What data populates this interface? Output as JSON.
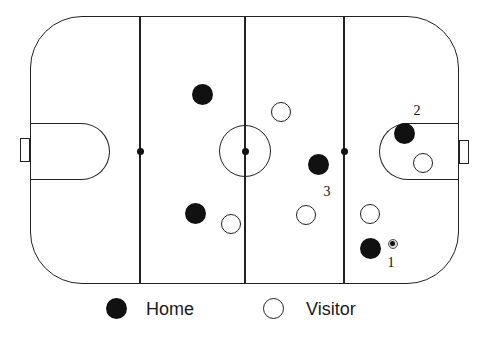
{
  "colors": {
    "background": "#ffffff",
    "line_stroke": "#222222",
    "home_fill": "#111111",
    "visitor_fill": "#ffffff",
    "text": "#1a1a1a"
  },
  "rink": {
    "x": 30,
    "y": 16,
    "width": 429,
    "height": 268,
    "corner_radius": 52,
    "vertical_lines_x": [
      140,
      245,
      344
    ],
    "faceoff_dots": [
      {
        "x": 140,
        "y": 151,
        "r": 3.5
      },
      {
        "x": 245,
        "y": 151,
        "r": 3.5
      },
      {
        "x": 344,
        "y": 151,
        "r": 3.5
      }
    ],
    "center_circle": {
      "x": 245,
      "y": 151,
      "r": 26
    },
    "creases": [
      {
        "side": "left",
        "x": 30,
        "y": 123,
        "width": 80,
        "height": 57
      },
      {
        "side": "right",
        "x": 379,
        "y": 123,
        "width": 80,
        "height": 57
      }
    ],
    "goals": [
      {
        "side": "left",
        "x": 20,
        "y": 138,
        "width": 10,
        "height": 24
      },
      {
        "side": "right",
        "x": 459,
        "y": 140,
        "width": 10,
        "height": 24
      }
    ]
  },
  "player_radius": {
    "home": 10.5,
    "visitor": 10
  },
  "players": [
    {
      "team": "home",
      "x": 202,
      "y": 94
    },
    {
      "team": "home",
      "x": 318,
      "y": 164
    },
    {
      "team": "home",
      "x": 404,
      "y": 133
    },
    {
      "team": "home",
      "x": 195,
      "y": 213
    },
    {
      "team": "home",
      "x": 370,
      "y": 248
    },
    {
      "team": "visitor",
      "x": 281,
      "y": 112
    },
    {
      "team": "visitor",
      "x": 423,
      "y": 163
    },
    {
      "team": "visitor",
      "x": 231,
      "y": 224
    },
    {
      "team": "visitor",
      "x": 306,
      "y": 215
    },
    {
      "team": "visitor",
      "x": 370,
      "y": 214
    }
  ],
  "puck": {
    "x": 393,
    "y": 244,
    "outer_r": 5,
    "inner_r": 2.5
  },
  "annotations": [
    {
      "text": "1",
      "x": 391,
      "y": 263
    },
    {
      "text": "2",
      "x": 417,
      "y": 111
    },
    {
      "text": "3",
      "x": 327,
      "y": 192
    }
  ],
  "legend": {
    "home_label": "Home",
    "visitor_label": "Visitor"
  }
}
